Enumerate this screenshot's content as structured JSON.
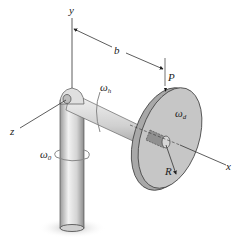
{
  "figure": {
    "axes": {
      "y": "y",
      "z": "z",
      "x": "x"
    },
    "dimension_b": "b",
    "point_P": "P",
    "radius_R": "R",
    "omega_0": {
      "symbol": "ω",
      "sub": "0"
    },
    "omega_h": {
      "symbol": "ω",
      "sub": "h"
    },
    "omega_d": {
      "symbol": "ω",
      "sub": "d"
    }
  }
}
